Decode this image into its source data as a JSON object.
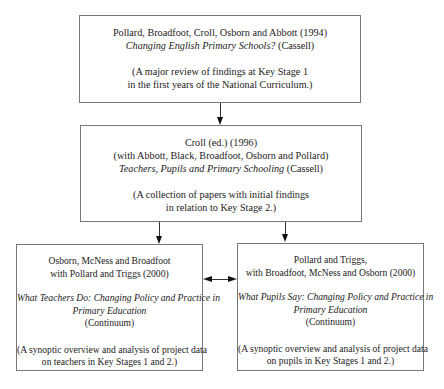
{
  "diagram": {
    "nodes": [
      {
        "id": "pollard-1994",
        "authors": "Pollard, Broadfoot, Croll, Osborn and Abbott (1994)",
        "title": "Changing English Primary Schools?",
        "publisher": "(Cassell)",
        "note_line1": "(A major review of findings at Key Stage 1",
        "note_line2": "in the first years of the National Curriculum.)"
      },
      {
        "id": "croll-1996",
        "authors_line1": "Croll (ed.) (1996)",
        "authors_line2": "(with Abbott, Black, Broadfoot, Osborn and Pollard)",
        "title": "Teachers, Pupils and Primary Schooling",
        "publisher": "(Cassell)",
        "note_line1": "(A collection of papers with initial findings",
        "note_line2": "in relation to Key Stage 2.)"
      },
      {
        "id": "osborn-2000",
        "authors_line1": "Osborn, McNess and Broadfoot",
        "authors_line2": "with Pollard and Triggs (2000)",
        "title_line1": "What Teachers Do: Changing Policy and Practice in",
        "title_line2": "Primary Education",
        "publisher": "(Continuum)",
        "note_line1": "(A synoptic overview and analysis of project data",
        "note_line2": "on teachers in Key Stages 1 and 2.)"
      },
      {
        "id": "pollard-triggs-2000",
        "authors_line1": "Pollard and Triggs,",
        "authors_line2": "with Broadfoot, McNess and Osborn (2000)",
        "title_line1": "What Pupils Say: Changing Policy and Practice in",
        "title_line2": "Primary Education",
        "publisher": "(Continuum)",
        "note_line1": "(A  synoptic overview and analysis of project data",
        "note_line2": "on pupils in Key Stages 1 and 2.)"
      }
    ],
    "edges": [
      {
        "from": "pollard-1994",
        "to": "croll-1996",
        "type": "arrow"
      },
      {
        "from": "croll-1996",
        "to": "osborn-2000",
        "type": "arrow"
      },
      {
        "from": "croll-1996",
        "to": "pollard-triggs-2000",
        "type": "arrow"
      },
      {
        "from": "osborn-2000",
        "to": "pollard-triggs-2000",
        "type": "bidirectional"
      }
    ]
  }
}
